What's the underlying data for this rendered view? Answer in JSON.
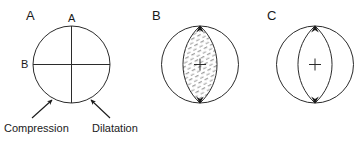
{
  "figure": {
    "background_color": "#ffffff",
    "line_color": "#2b2b2b",
    "text_color": "#1a1a1a",
    "hatch_color": "#8a8a8a",
    "panels": [
      {
        "letter": "A",
        "kind": "quadrants",
        "description": "Circle divided into four quadrants by vertical and horizontal nodal planes; upper-right and lower-left quadrants hatched",
        "axis_labels": [
          {
            "text": "A",
            "position": "top"
          },
          {
            "text": "B",
            "position": "left"
          }
        ],
        "hatched_regions": [
          "upper-right",
          "lower-left"
        ],
        "white_regions": [
          "upper-left",
          "lower-right"
        ]
      },
      {
        "letter": "B",
        "kind": "lens",
        "description": "Circle with hatched lens (vesica) spanning top to bottom; small cross at center",
        "hatched_regions": [
          "central-lens"
        ],
        "white_regions": [
          "left-crescent",
          "right-crescent"
        ],
        "center_mark": "cross",
        "tip_markers": [
          "top-arrowhead",
          "bottom-arrowhead"
        ]
      },
      {
        "letter": "C",
        "kind": "crescents",
        "description": "Circle with hatched left and right crescents; white lens in middle; small cross at center",
        "hatched_regions": [
          "left-crescent",
          "right-crescent"
        ],
        "white_regions": [
          "central-lens"
        ],
        "center_mark": "cross",
        "tip_markers": [
          "top-arrowhead",
          "bottom-arrowhead"
        ]
      }
    ],
    "captions": [
      {
        "text": "Compression",
        "points_to": "lower-left-quadrant"
      },
      {
        "text": "Dilatation",
        "points_to": "lower-right-quadrant"
      }
    ]
  }
}
